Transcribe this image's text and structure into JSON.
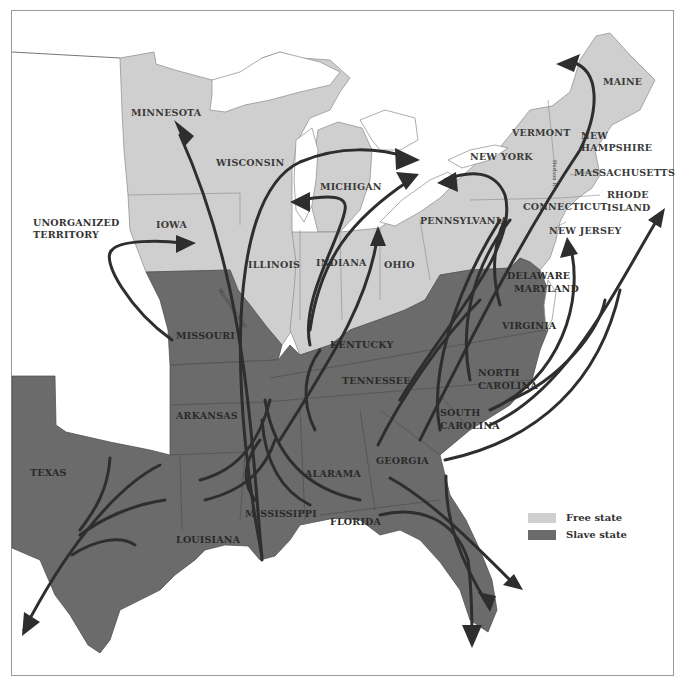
{
  "map": {
    "subject": "Migration routes of enslaved people / escape routes, pre-Civil War United States",
    "colors": {
      "free_state": "#cfcfcf",
      "slave_state": "#6b6b6b",
      "water": "#ffffff",
      "route": "#2e2e2e",
      "border": "#9a9a9a"
    },
    "labels": {
      "minnesota": "MINNESOTA",
      "wisconsin": "WISCONSIN",
      "iowa": "IOWA",
      "unorganized_1": "UNORGANIZED",
      "unorganized_2": "TERRITORY",
      "illinois": "ILLINOIS",
      "indiana": "INDIANA",
      "ohio": "OHIO",
      "michigan": "MICHIGAN",
      "new_york": "NEW YORK",
      "pennsylvania": "PENNSYLVANIA",
      "vermont": "VERMONT",
      "new_hampshire_1": "NEW",
      "new_hampshire_2": "HAMPSHIRE",
      "maine": "MAINE",
      "massachusetts": "MASSACHUSETTS",
      "rhode_island_1": "RHODE",
      "rhode_island_2": "ISLAND",
      "connecticut": "CONNECTICUT",
      "new_jersey": "NEW JERSEY",
      "delaware": "DELAWARE",
      "maryland": "MARYLAND",
      "virginia": "VIRGINIA",
      "kentucky": "KENTUCKY",
      "tennessee": "TENNESSEE",
      "north_carolina_1": "NORTH",
      "north_carolina_2": "CAROLINA",
      "south_carolina_1": "SOUTH",
      "south_carolina_2": "CAROLINA",
      "georgia": "GEORGIA",
      "alabama": "ALARAMA",
      "mississippi": "MISSISSIPPI",
      "florida": "FLORIDA",
      "louisiana": "LOUISIANA",
      "arkansas": "ARKANSAS",
      "missouri": "MISSOURI",
      "texas": "TEXAS",
      "hudson_river": "Hudson R.",
      "mississippi_river": "Mississippi River"
    }
  },
  "legend": {
    "items": [
      {
        "label": "Free state",
        "color": "#cfcfcf"
      },
      {
        "label": "Slave state",
        "color": "#6b6b6b"
      }
    ]
  }
}
